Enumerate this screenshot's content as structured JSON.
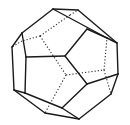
{
  "figure": {
    "style": "wireframe line drawing with dashed hidden edges",
    "colors": {
      "background": "#ffffff",
      "edge": "#1a1a1a"
    }
  },
  "vertices": {
    "A": [
      53,
      9
    ],
    "B": [
      78,
      10
    ],
    "C": [
      22,
      33
    ],
    "D": [
      107,
      38
    ],
    "E": [
      117,
      43
    ],
    "F": [
      12,
      47
    ],
    "G": [
      26,
      57
    ],
    "H": [
      65,
      56
    ],
    "I": [
      87,
      29
    ],
    "J": [
      118,
      74
    ],
    "K": [
      87,
      84
    ],
    "L": [
      14,
      90
    ],
    "M": [
      25,
      93
    ],
    "N": [
      111,
      94
    ],
    "O": [
      62,
      108
    ],
    "P": [
      45,
      113
    ],
    "Q": [
      79,
      119
    ],
    "h1": [
      70,
      15
    ],
    "h2": [
      40,
      36
    ],
    "h3": [
      66,
      75
    ],
    "h4": [
      104,
      70
    ],
    "h5": [
      22,
      41
    ]
  },
  "solid_edges": [
    [
      "A",
      "B"
    ],
    [
      "A",
      "C"
    ],
    [
      "A",
      "D"
    ],
    [
      "B",
      "E"
    ],
    [
      "D",
      "E"
    ],
    [
      "C",
      "F"
    ],
    [
      "C",
      "G"
    ],
    [
      "G",
      "H"
    ],
    [
      "H",
      "I"
    ],
    [
      "H",
      "K"
    ],
    [
      "E",
      "J"
    ],
    [
      "J",
      "K"
    ],
    [
      "J",
      "N"
    ],
    [
      "F",
      "L"
    ],
    [
      "G",
      "M"
    ],
    [
      "L",
      "M"
    ],
    [
      "L",
      "P"
    ],
    [
      "M",
      "O"
    ],
    [
      "K",
      "O"
    ],
    [
      "O",
      "Q"
    ],
    [
      "P",
      "Q"
    ],
    [
      "N",
      "Q"
    ],
    [
      "I",
      "D"
    ]
  ],
  "hidden_edges": [
    [
      "h1",
      "h2"
    ],
    [
      "h2",
      "h5"
    ],
    [
      "h2",
      "h3"
    ],
    [
      "h3",
      "h4"
    ],
    [
      "h4",
      "D"
    ],
    [
      "h4",
      "N"
    ],
    [
      "h3",
      "P"
    ],
    [
      "h1",
      "B"
    ],
    [
      "h5",
      "F"
    ]
  ]
}
